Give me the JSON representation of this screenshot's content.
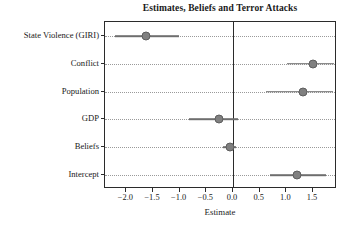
{
  "chart_data": {
    "type": "scatter",
    "title": "Estimates, Beliefs and Terror Attacks",
    "xlabel": "Estimate",
    "ylabel": "",
    "grid": true,
    "legend": "none",
    "xlim": [
      -2.4,
      1.95
    ],
    "xticks": [
      -2.0,
      -1.5,
      -1.0,
      -0.5,
      0.0,
      0.5,
      1.0,
      1.5
    ],
    "xtick_labels": [
      "-2.0",
      "-1.5",
      "-1.0",
      "-0.5",
      "0.0",
      "0.5",
      "1.0",
      "1.5"
    ],
    "reference_line": 0.0,
    "categories": [
      "State Violence (GIRI)",
      "Conflict",
      "Population",
      "GDP",
      "Beliefs",
      "Intercept"
    ],
    "points": [
      {
        "label": "State Violence (GIRI)",
        "estimate": -1.63,
        "ci_low": -2.22,
        "ci_high": -1.02
      },
      {
        "label": "Conflict",
        "estimate": 1.5,
        "ci_low": 1.02,
        "ci_high": 1.89
      },
      {
        "label": "Population",
        "estimate": 1.32,
        "ci_low": 0.62,
        "ci_high": 1.88
      },
      {
        "label": "GDP",
        "estimate": -0.27,
        "ci_low": -0.83,
        "ci_high": 0.09
      },
      {
        "label": "Beliefs",
        "estimate": -0.06,
        "ci_low": -0.18,
        "ci_high": 0.06
      },
      {
        "label": "Intercept",
        "estimate": 1.2,
        "ci_low": 0.7,
        "ci_high": 1.74
      }
    ],
    "colors": {
      "point": "#808080",
      "interval": "#6e6e6e",
      "axis": "#2b2b2b",
      "grid": "#9a9a9a",
      "background": "#ffffff"
    }
  }
}
